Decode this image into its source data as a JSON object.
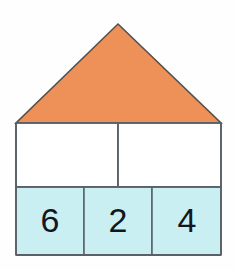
{
  "figure": {
    "background_color": "#fefefe",
    "roof": {
      "name": "roof-triangle",
      "fill_color": "#ee9159",
      "stroke_color": "#55504c",
      "apex": {
        "x": 118,
        "y": 24
      },
      "left_corner": {
        "x": 16,
        "y": 123
      },
      "right_corner": {
        "x": 221,
        "y": 123
      }
    },
    "body": {
      "name": "house-body",
      "fill_color": "#ffffff",
      "stroke_color": "#5a6068",
      "left": 16,
      "top": 123,
      "right": 221,
      "bottom": 255
    },
    "upper_row": {
      "name": "upper-row",
      "divider_x": 118,
      "top": 123,
      "bottom": 187,
      "cells": [
        {
          "label": "",
          "fill_color": "#ffffff"
        },
        {
          "label": "",
          "fill_color": "#ffffff"
        }
      ]
    },
    "lower_row": {
      "name": "lower-row",
      "top": 187,
      "bottom": 255,
      "fill_color": "#c9eff2",
      "divider_x_1": 84,
      "divider_x_2": 152,
      "cells": [
        {
          "value": "6",
          "center_x": 50,
          "center_y": 222
        },
        {
          "value": "2",
          "center_x": 118,
          "center_y": 222
        },
        {
          "value": "4",
          "center_x": 187,
          "center_y": 222
        }
      ]
    }
  }
}
